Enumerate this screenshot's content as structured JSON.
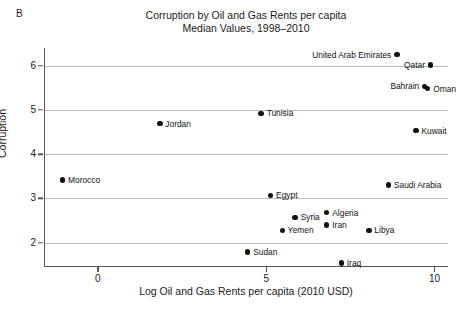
{
  "panel": {
    "label": "B"
  },
  "chart_data": {
    "type": "scatter",
    "title": "Corruption by Oil and Gas Rents per capita",
    "subtitle": "Median Values, 1998–2010",
    "title_lines": [
      "Corruption by Oil and Gas Rents per capita",
      "Median Values, 1998–2010"
    ],
    "xlabel": "Log Oil and Gas Rents per capita (2010 USD)",
    "ylabel": "Corruption",
    "xlim": [
      -1.6,
      10.4
    ],
    "ylim": [
      1.45,
      6.4
    ],
    "xticks": [
      0,
      5,
      10
    ],
    "xtick_labels": [
      "0",
      "5",
      "10"
    ],
    "yticks": [
      2,
      3,
      4,
      5,
      6
    ],
    "ytick_labels": [
      "2",
      "3",
      "4",
      "5",
      "6"
    ],
    "grid": "horizontal",
    "legend": "none",
    "marker_color": "#111111",
    "grid_color": "#b9b9b9",
    "axis_color": "#555555",
    "points": [
      {
        "name": "United Arab Emirates",
        "x": 8.85,
        "y": 6.25,
        "label_side": "left"
      },
      {
        "name": "Qatar",
        "x": 9.85,
        "y": 6.02,
        "label_side": "left"
      },
      {
        "name": "Bahrain",
        "x": 9.68,
        "y": 5.53,
        "label_side": "left"
      },
      {
        "name": "Oman",
        "x": 9.77,
        "y": 5.48,
        "label_side": "right"
      },
      {
        "name": "Tunisia",
        "x": 4.82,
        "y": 4.92,
        "label_side": "right"
      },
      {
        "name": "Jordan",
        "x": 1.81,
        "y": 4.69,
        "label_side": "right"
      },
      {
        "name": "Kuwait",
        "x": 9.42,
        "y": 4.53,
        "label_side": "right"
      },
      {
        "name": "Morocco",
        "x": -1.08,
        "y": 3.42,
        "label_side": "right"
      },
      {
        "name": "Saudi Arabia",
        "x": 8.6,
        "y": 3.3,
        "label_side": "right"
      },
      {
        "name": "Egypt",
        "x": 5.1,
        "y": 3.07,
        "label_side": "right"
      },
      {
        "name": "Algeria",
        "x": 6.77,
        "y": 2.68,
        "label_side": "right"
      },
      {
        "name": "Syria",
        "x": 5.83,
        "y": 2.57,
        "label_side": "right"
      },
      {
        "name": "Iran",
        "x": 6.77,
        "y": 2.4,
        "label_side": "right"
      },
      {
        "name": "Yemen",
        "x": 5.45,
        "y": 2.28,
        "label_side": "right"
      },
      {
        "name": "Libya",
        "x": 8.02,
        "y": 2.28,
        "label_side": "right"
      },
      {
        "name": "Sudan",
        "x": 4.42,
        "y": 1.79,
        "label_side": "right"
      },
      {
        "name": "Iraq",
        "x": 7.2,
        "y": 1.54,
        "label_side": "right"
      }
    ]
  }
}
